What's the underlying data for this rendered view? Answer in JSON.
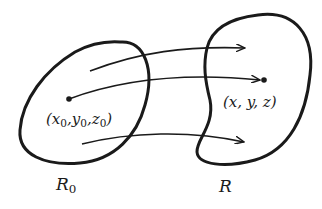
{
  "figure": {
    "regions": [
      {
        "id": "R0",
        "label_main": "R",
        "label_sub": "0",
        "shape": "tilted oval"
      },
      {
        "id": "R",
        "label_main": "R",
        "label_sub": "",
        "shape": "kidney/bean"
      }
    ],
    "points": [
      {
        "id": "source",
        "label_parts": [
          "(",
          "x",
          "0",
          ", ",
          "y",
          "0",
          ", ",
          "z",
          "0",
          ")"
        ],
        "label_text": "(x0, y0, z0)"
      },
      {
        "id": "target",
        "label_text": "(x, y, z)"
      }
    ],
    "arrows": [
      {
        "from": "R0 interior (upper)",
        "to": "R interior (upper)"
      },
      {
        "from": "point (x0,y0,z0)",
        "to": "point (x,y,z)"
      },
      {
        "from": "R0 interior (lower)",
        "to": "R interior (lower)"
      }
    ],
    "colors": {
      "stroke": "#1a1a1a",
      "background": "#ffffff"
    }
  },
  "labels": {
    "p0": {
      "x": "x",
      "y": "y",
      "z": "z",
      "sub": "0",
      "open": "(",
      "close": ")",
      "sep": ","
    },
    "p": "(x, y, z)",
    "R0_main": "R",
    "R0_sub": "0",
    "R_main": "R"
  }
}
